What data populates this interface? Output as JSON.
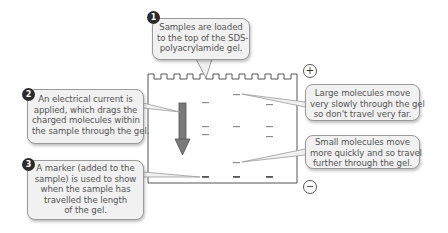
{
  "diagram": {
    "type": "SDS-PAGE gel electrophoresis",
    "steps": [
      {
        "number": "1",
        "lines": [
          "Samples are loaded",
          "to the top of the SDS-",
          "polyacrylamide gel."
        ]
      },
      {
        "number": "2",
        "lines": [
          "An electrical current is",
          "applied, which drags the",
          "charged molecules within",
          "the sample through the gel."
        ]
      },
      {
        "number": "3",
        "lines": [
          "A marker (added to the",
          "sample) is used to show",
          "when the sample has",
          "travelled the length",
          "of the gel."
        ]
      }
    ],
    "annotations": {
      "large": {
        "lines": [
          "Large molecules move",
          "very slowly through the gel",
          "so don't travel very far."
        ]
      },
      "small": {
        "lines": [
          "Small molecules move",
          "more quickly and so travel",
          "further through the gel."
        ]
      }
    },
    "electrodes": {
      "positive": "+",
      "negative": "−"
    },
    "gel": {
      "lanes": [
        {
          "x": 205,
          "bands_y": [
            103,
            127,
            135,
            177
          ]
        },
        {
          "x": 236,
          "bands_y": [
            95,
            127,
            163,
            177
          ]
        },
        {
          "x": 270,
          "bands_y": [
            105,
            127,
            137,
            177
          ]
        }
      ],
      "marker_band_y": 177
    },
    "colors": {
      "callout_fill": "#f1f1f1",
      "callout_border": "#9a9a9a",
      "badge": "#2b2b2b",
      "arrow": "#7a7a7a",
      "gel_outline": "#555555",
      "band": "#8a8a8a"
    }
  }
}
